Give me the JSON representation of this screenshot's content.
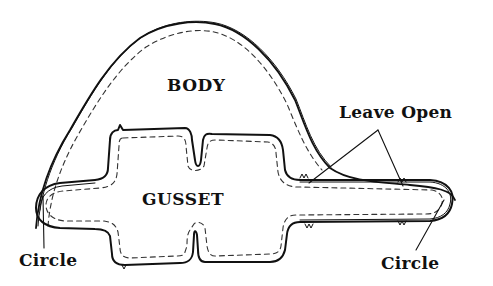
{
  "diagram": {
    "type": "sewing-pattern",
    "pieces": [
      {
        "id": "body",
        "label": "BODY"
      },
      {
        "id": "gusset",
        "label": "GUSSET"
      }
    ],
    "annotations": {
      "leave_open": "Leave Open",
      "circle_left": "Circle",
      "circle_right": "Circle"
    },
    "styles": {
      "cut_line_color": "#111111",
      "stitch_line_color": "#333333",
      "background": "#ffffff"
    }
  }
}
